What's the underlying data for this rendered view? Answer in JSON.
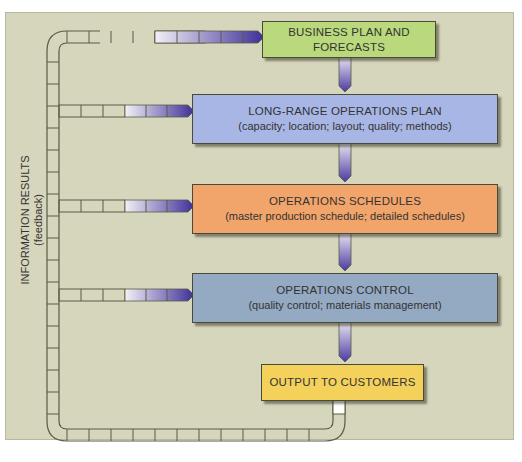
{
  "diagram": {
    "type": "flowchart",
    "boxes": [
      {
        "id": "business-plan",
        "title": "BUSINESS PLAN AND",
        "title2": "FORECASTS",
        "subtitle": "",
        "color": "#b9d97c"
      },
      {
        "id": "long-range-plan",
        "title": "LONG-RANGE OPERATIONS PLAN",
        "subtitle": "(capacity; location; layout; quality; methods)",
        "color": "#a8b6e6"
      },
      {
        "id": "operations-schedules",
        "title": "OPERATIONS SCHEDULES",
        "subtitle": "(master production schedule; detailed schedules)",
        "color": "#f2a56a"
      },
      {
        "id": "operations-control",
        "title": "OPERATIONS CONTROL",
        "subtitle": "(quality control; materials management)",
        "color": "#94a9c2"
      },
      {
        "id": "output",
        "title": "OUTPUT TO CUSTOMERS",
        "subtitle": "",
        "color": "#f3d15a"
      }
    ],
    "feedback_label": {
      "line1": "INFORMATION RESULTS",
      "line2": "(feedback)"
    },
    "flows": [
      {
        "from": "business-plan",
        "to": "long-range-plan"
      },
      {
        "from": "long-range-plan",
        "to": "operations-schedules"
      },
      {
        "from": "operations-schedules",
        "to": "operations-control"
      },
      {
        "from": "operations-control",
        "to": "output"
      },
      {
        "from": "output",
        "to": "feedback-loop"
      },
      {
        "from": "feedback-loop",
        "to": "business-plan"
      },
      {
        "from": "feedback-loop",
        "to": "long-range-plan"
      },
      {
        "from": "feedback-loop",
        "to": "operations-schedules"
      },
      {
        "from": "feedback-loop",
        "to": "operations-control"
      }
    ],
    "colors": {
      "background": "#d6d6bd",
      "arrow": "#4a3aa0",
      "pipe_border": "#5a5a45"
    }
  }
}
